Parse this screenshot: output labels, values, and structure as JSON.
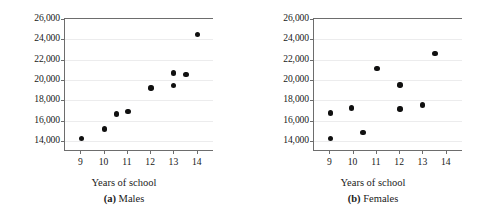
{
  "figure": {
    "panel_count": 2
  },
  "chart_data": [
    {
      "type": "scatter",
      "panel_id": "a",
      "panel_letter": "(a)",
      "panel_title": "Males",
      "caption": "(a) Males",
      "title": "",
      "xlabel": "Years of school",
      "ylabel": "Income ($)",
      "xlim": [
        8.3,
        14.7
      ],
      "ylim": [
        13000,
        26000
      ],
      "xticks": [
        9,
        10,
        11,
        12,
        13,
        14
      ],
      "xticklabels": [
        "9",
        "10",
        "11",
        "12",
        "13",
        "14"
      ],
      "yticks": [
        14000,
        16000,
        18000,
        20000,
        22000,
        24000,
        26000
      ],
      "yticklabels": [
        "14,000",
        "16,000",
        "18,000",
        "20,000",
        "22,000",
        "24,000",
        "26,000"
      ],
      "grid": "horizontal",
      "legend": "none",
      "marker_color": "#101010",
      "points": [
        {
          "x": 9.0,
          "y": 14250
        },
        {
          "x": 10.0,
          "y": 15150
        },
        {
          "x": 10.5,
          "y": 16650
        },
        {
          "x": 11.0,
          "y": 16900
        },
        {
          "x": 12.0,
          "y": 19200
        },
        {
          "x": 12.95,
          "y": 20700
        },
        {
          "x": 12.95,
          "y": 19450
        },
        {
          "x": 13.5,
          "y": 20550
        },
        {
          "x": 14.0,
          "y": 24500
        }
      ]
    },
    {
      "type": "scatter",
      "panel_id": "b",
      "panel_letter": "(b)",
      "panel_title": "Females",
      "caption": "(b) Females",
      "title": "",
      "xlabel": "Years of school",
      "ylabel": "Income ($)",
      "xlim": [
        8.3,
        14.7
      ],
      "ylim": [
        13000,
        26000
      ],
      "xticks": [
        9,
        10,
        11,
        12,
        13,
        14
      ],
      "xticklabels": [
        "9",
        "10",
        "11",
        "12",
        "13",
        "14"
      ],
      "yticks": [
        14000,
        16000,
        18000,
        20000,
        22000,
        24000,
        26000
      ],
      "yticklabels": [
        "14,000",
        "16,000",
        "18,000",
        "20,000",
        "22,000",
        "24,000",
        "26,000"
      ],
      "grid": "horizontal",
      "legend": "none",
      "marker_color": "#101010",
      "points": [
        {
          "x": 9.0,
          "y": 16750
        },
        {
          "x": 9.0,
          "y": 14250
        },
        {
          "x": 9.9,
          "y": 17250
        },
        {
          "x": 10.4,
          "y": 14850
        },
        {
          "x": 11.0,
          "y": 21100
        },
        {
          "x": 12.0,
          "y": 19500
        },
        {
          "x": 12.0,
          "y": 17150
        },
        {
          "x": 12.95,
          "y": 17550
        },
        {
          "x": 13.5,
          "y": 22600
        }
      ]
    }
  ]
}
